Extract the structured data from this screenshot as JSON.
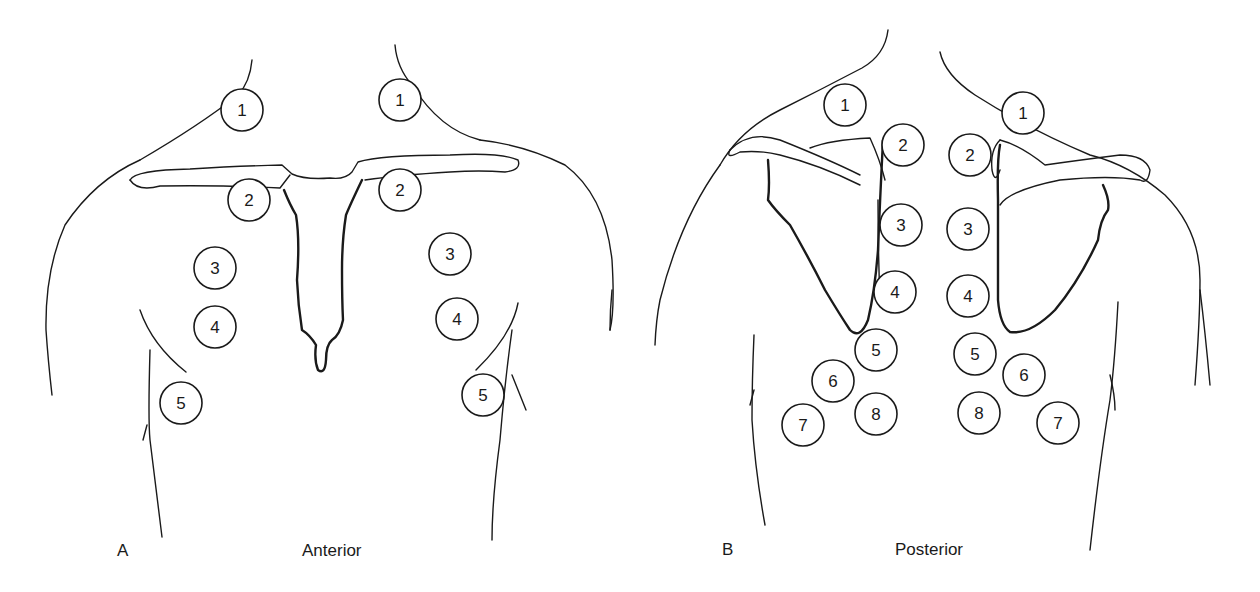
{
  "panels": [
    {
      "letter": "A",
      "caption": "Anterior",
      "points": [
        {
          "n": "1",
          "x": 242,
          "y": 110
        },
        {
          "n": "1",
          "x": 400,
          "y": 100
        },
        {
          "n": "2",
          "x": 249,
          "y": 200
        },
        {
          "n": "2",
          "x": 400,
          "y": 190
        },
        {
          "n": "3",
          "x": 215,
          "y": 268
        },
        {
          "n": "3",
          "x": 450,
          "y": 254
        },
        {
          "n": "4",
          "x": 215,
          "y": 327
        },
        {
          "n": "4",
          "x": 457,
          "y": 319
        },
        {
          "n": "5",
          "x": 181,
          "y": 403
        },
        {
          "n": "5",
          "x": 483,
          "y": 395
        }
      ]
    },
    {
      "letter": "B",
      "caption": "Posterior",
      "points": [
        {
          "n": "1",
          "x": 845,
          "y": 105
        },
        {
          "n": "1",
          "x": 1023,
          "y": 113
        },
        {
          "n": "2",
          "x": 903,
          "y": 145
        },
        {
          "n": "2",
          "x": 970,
          "y": 155
        },
        {
          "n": "3",
          "x": 901,
          "y": 225
        },
        {
          "n": "3",
          "x": 968,
          "y": 229
        },
        {
          "n": "4",
          "x": 895,
          "y": 292
        },
        {
          "n": "4",
          "x": 968,
          "y": 296
        },
        {
          "n": "5",
          "x": 876,
          "y": 350
        },
        {
          "n": "5",
          "x": 975,
          "y": 354
        },
        {
          "n": "6",
          "x": 833,
          "y": 381
        },
        {
          "n": "6",
          "x": 1024,
          "y": 375
        },
        {
          "n": "7",
          "x": 803,
          "y": 425
        },
        {
          "n": "7",
          "x": 1058,
          "y": 423
        },
        {
          "n": "8",
          "x": 876,
          "y": 414
        },
        {
          "n": "8",
          "x": 979,
          "y": 413
        }
      ]
    }
  ],
  "style": {
    "stroke": "#1a1a1a",
    "background": "#ffffff",
    "circle_radius": 21
  }
}
